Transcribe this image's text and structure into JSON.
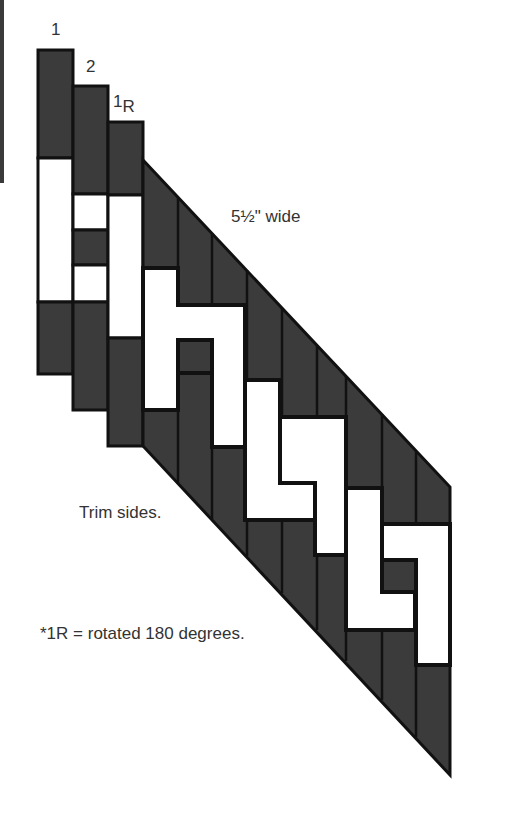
{
  "diagram": {
    "strip_labels": [
      {
        "text": "1",
        "x": 50,
        "y": 20
      },
      {
        "text": "2",
        "x": 86,
        "y": 57
      },
      {
        "text": "1",
        "sub": "R",
        "x": 115,
        "y": 95
      }
    ],
    "width_label": "5½\" wide",
    "trim_note": "Trim sides.",
    "rotation_note": "*1R = rotated 180 degrees.",
    "colors": {
      "dark_fabric": "#3b3b3b",
      "light_fabric": "#ffffff",
      "outline": "#111111",
      "text": "#333333"
    }
  }
}
